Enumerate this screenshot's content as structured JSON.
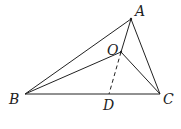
{
  "diagram": {
    "type": "geometry",
    "points": {
      "A": {
        "label": "A",
        "x": 131,
        "y": 19
      },
      "B": {
        "label": "B",
        "x": 25,
        "y": 94
      },
      "C": {
        "label": "C",
        "x": 160,
        "y": 94
      },
      "O": {
        "label": "O",
        "x": 121,
        "y": 52
      },
      "D": {
        "label": "D",
        "x": 109,
        "y": 94
      }
    },
    "segments": [
      {
        "from": "A",
        "to": "B",
        "style": "solid"
      },
      {
        "from": "A",
        "to": "C",
        "style": "solid"
      },
      {
        "from": "B",
        "to": "C",
        "style": "solid"
      },
      {
        "from": "A",
        "to": "O",
        "style": "solid"
      },
      {
        "from": "B",
        "to": "O",
        "style": "solid"
      },
      {
        "from": "O",
        "to": "C",
        "style": "solid"
      },
      {
        "from": "O",
        "to": "D",
        "style": "dashed"
      }
    ],
    "labels": {
      "A": "A",
      "B": "B",
      "C": "C",
      "O": "O",
      "D": "D"
    },
    "line_color": "#222222"
  }
}
